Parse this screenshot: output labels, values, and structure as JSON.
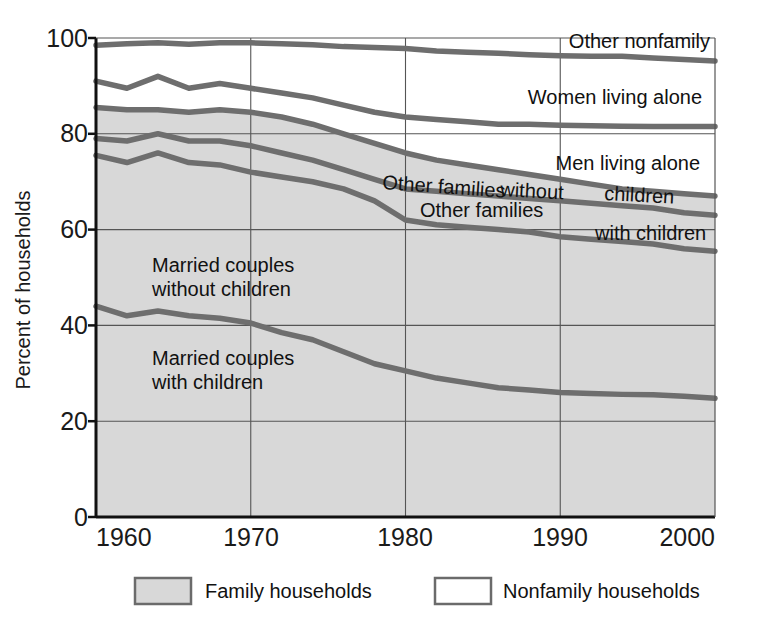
{
  "chart_data": {
    "type": "area",
    "title": "",
    "subtitle": "",
    "xlabel": "",
    "ylabel": "Percent of households",
    "xlim": [
      1960,
      2000
    ],
    "ylim": [
      0,
      100
    ],
    "grid": true,
    "x_ticks": [
      "1960",
      "1970",
      "1980",
      "1990",
      "2000"
    ],
    "y_ticks": [
      "0",
      "20",
      "40",
      "60",
      "80",
      "100"
    ],
    "stacking_note": "Cumulative boundary lines; bands read bottom-to-top",
    "x": [
      1960,
      1962,
      1964,
      1966,
      1968,
      1970,
      1972,
      1974,
      1976,
      1978,
      1980,
      1982,
      1984,
      1986,
      1988,
      1990,
      1992,
      1994,
      1996,
      1998,
      2000
    ],
    "series": [
      {
        "name": "Married couples with children",
        "band_label": "Married couples\nwith children",
        "shading": "family",
        "cumulative_values": [
          44,
          42,
          43,
          42,
          41.5,
          40.5,
          38.5,
          37,
          34.5,
          32,
          30.5,
          29,
          28,
          27,
          26.5,
          26,
          25.8,
          25.6,
          25.5,
          25.2,
          24.8
        ]
      },
      {
        "name": "Married couples without children",
        "band_label": "Married couples\nwithout children",
        "shading": "family",
        "cumulative_values": [
          75.5,
          74,
          76,
          74,
          73.5,
          72,
          71,
          70,
          68.5,
          66,
          62,
          61,
          60.5,
          60,
          59.5,
          58.5,
          58,
          57.5,
          57,
          56,
          55.5
        ]
      },
      {
        "name": "Other families with children",
        "band_label": "Other families\nwith children",
        "shading": "family",
        "cumulative_values": [
          79,
          78.5,
          80,
          78.5,
          78.5,
          77.5,
          76,
          74.5,
          72.5,
          70.5,
          68.5,
          68,
          67.5,
          67,
          66.5,
          66,
          65.5,
          65,
          64.5,
          63.5,
          63
        ]
      },
      {
        "name": "Other families without children",
        "band_label": "Other families  without  children",
        "shading": "family",
        "cumulative_values": [
          85.5,
          85,
          85,
          84.5,
          85,
          84.5,
          83.5,
          82,
          80,
          78,
          76,
          74.5,
          73.5,
          72.5,
          71.5,
          70.5,
          69.5,
          68.5,
          68,
          67.5,
          67
        ]
      },
      {
        "name": "Men living alone",
        "band_label": "Men living alone",
        "shading": "nonfamily",
        "cumulative_values": [
          91,
          89.5,
          92,
          89.5,
          90.5,
          89.5,
          88.5,
          87.5,
          86,
          84.5,
          83.5,
          83,
          82.5,
          82,
          82,
          81.8,
          81.7,
          81.6,
          81.5,
          81.5,
          81.5
        ]
      },
      {
        "name": "Women living alone",
        "band_label": "Women living alone",
        "shading": "nonfamily",
        "cumulative_values": [
          98.5,
          98.8,
          99,
          98.7,
          99,
          99,
          98.8,
          98.6,
          98.2,
          98,
          97.8,
          97.3,
          97,
          96.8,
          96.5,
          96.3,
          96.2,
          96.2,
          95.8,
          95.5,
          95.2
        ]
      },
      {
        "name": "Other nonfamily",
        "band_label": "Other nonfamily",
        "shading": "nonfamily",
        "cumulative_values": [
          100,
          100,
          100,
          100,
          100,
          100,
          100,
          100,
          100,
          100,
          100,
          100,
          100,
          100,
          100,
          100,
          100,
          100,
          100,
          100,
          100
        ]
      }
    ],
    "band_labels": [
      {
        "text": "Other nonfamily",
        "x": 1978,
        "y": 98
      },
      {
        "text": "Women living alone",
        "x": 1975,
        "y": 91.5
      },
      {
        "text": "Men living alone",
        "x": 1977,
        "y": 75.5
      },
      {
        "text": "Other families",
        "x": 1963,
        "y": 69.5
      },
      {
        "text": "without",
        "x": 1972,
        "y": 67.5
      },
      {
        "text": "children",
        "x": 1978,
        "y": 66
      },
      {
        "text": "Other families",
        "x": 1966,
        "y": 64.5
      },
      {
        "text": "with children",
        "x": 1975,
        "y": 60.5
      },
      {
        "text": "Married couples",
        "x": 1964,
        "y": 49
      },
      {
        "text": "without children",
        "x": 1964,
        "y": 45
      },
      {
        "text": "Married couples",
        "x": 1964,
        "y": 33
      },
      {
        "text": "with children",
        "x": 1964,
        "y": 29
      }
    ],
    "legend": {
      "position": "bottom",
      "items": [
        {
          "label": "Family households",
          "swatch_fill": "#d5d5d5",
          "swatch_stroke": "#6b6b6b"
        },
        {
          "label": "Nonfamily households",
          "swatch_fill": "#ffffff",
          "swatch_stroke": "#6b6b6b"
        }
      ]
    },
    "colors": {
      "family_fill": "#d8d8d8",
      "nonfamily_fill": "#ffffff",
      "line": "#6e6e6e",
      "axis": "#111111",
      "grid": "#555555",
      "text": "#111111"
    }
  },
  "axis": {
    "y_title": "Percent of households",
    "y_ticks": [
      "100",
      "80",
      "60",
      "40",
      "20",
      "0"
    ],
    "x_ticks": [
      "1960",
      "1970",
      "1980",
      "1990",
      "2000"
    ]
  },
  "labels": {
    "other_nonfamily": "Other nonfamily",
    "women_living_alone": "Women living alone",
    "men_living_alone": "Men living alone",
    "other_families_1": "Other families",
    "other_families_without": "without",
    "other_families_children": "children",
    "other_families_2": "Other families",
    "other_families_with_children": "with children",
    "married_without_l1": "Married couples",
    "married_without_l2": "without children",
    "married_with_l1": "Married couples",
    "married_with_l2": "with children"
  },
  "legend": {
    "family_label": "Family households",
    "nonfamily_label": "Nonfamily households"
  }
}
